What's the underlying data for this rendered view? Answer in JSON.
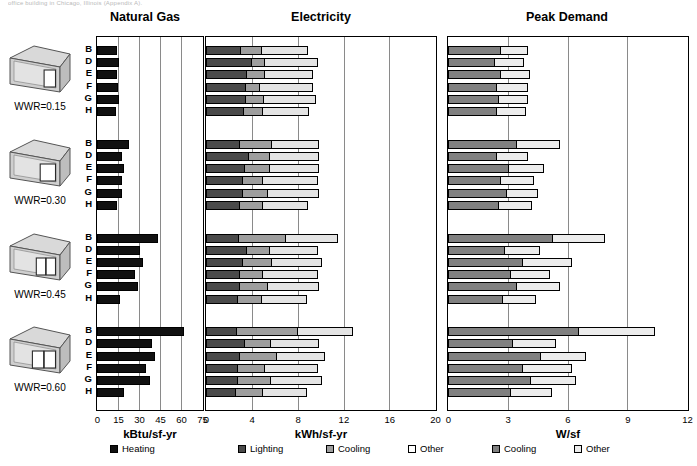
{
  "caption": "office building in Chicago, Illinois (Appendix A).",
  "panels": {
    "gas": {
      "title": "Natural Gas",
      "axis_label": "kBtu/sf-yr",
      "ticks": [
        0,
        15,
        30,
        45,
        60,
        75
      ],
      "xmax": 75
    },
    "elec": {
      "title": "Electricity",
      "axis_label": "kWh/sf-yr",
      "ticks": [
        0,
        4,
        8,
        12,
        16,
        20
      ],
      "xmax": 20
    },
    "peak": {
      "title": "Peak Demand",
      "axis_label": "W/sf",
      "ticks": [
        0,
        3,
        6,
        9,
        12
      ],
      "xmax": 12
    }
  },
  "groups": [
    {
      "wwr_label": "WWR=0.15",
      "wwr": 0.15
    },
    {
      "wwr_label": "WWR=0.30",
      "wwr": 0.3
    },
    {
      "wwr_label": "WWR=0.45",
      "wwr": 0.45
    },
    {
      "wwr_label": "WWR=0.60",
      "wwr": 0.6
    }
  ],
  "row_labels": [
    "B",
    "D",
    "E",
    "F",
    "G",
    "H"
  ],
  "legends": {
    "gas": [
      {
        "label": "Heating",
        "color": "#111111"
      }
    ],
    "elec": [
      {
        "label": "Lighting",
        "color": "#4a4a4a"
      },
      {
        "label": "Cooling",
        "color": "#9e9e9e"
      },
      {
        "label": "Other",
        "color": "#ffffff"
      }
    ],
    "peak": [
      {
        "label": "Cooling",
        "color": "#808080"
      },
      {
        "label": "Other",
        "color": "#ececec"
      }
    ]
  },
  "colors": {
    "heating": "#111111",
    "lighting": "#4a4a4a",
    "cooling_elec": "#9e9e9e",
    "other_elec": "#e4e4e4",
    "cooling_peak": "#808080",
    "other_peak": "#ececec",
    "axis": "#000000",
    "grid": "#8a8a8a"
  },
  "chart_data": [
    {
      "type": "bar",
      "orientation": "horizontal",
      "title": "Natural Gas",
      "xlabel": "kBtu/sf-yr",
      "ylabel": "",
      "xlim": [
        0,
        75
      ],
      "xticks": [
        0,
        15,
        30,
        45,
        60,
        75
      ],
      "grid": true,
      "legend_position": "bottom",
      "groups": [
        "WWR=0.15",
        "WWR=0.30",
        "WWR=0.45",
        "WWR=0.60"
      ],
      "categories": [
        "B",
        "D",
        "E",
        "F",
        "G",
        "H"
      ],
      "series": [
        {
          "name": "Heating",
          "color": "#111111",
          "values_by_group": [
            [
              14.0,
              16.0,
              14.5,
              15.0,
              15.5,
              13.5
            ],
            [
              22.5,
              18.0,
              19.5,
              17.5,
              18.0,
              14.5
            ],
            [
              43.5,
              30.5,
              33.0,
              27.0,
              29.5,
              16.5
            ],
            [
              62.0,
              39.5,
              41.5,
              35.0,
              37.5,
              19.5
            ]
          ]
        }
      ]
    },
    {
      "type": "bar",
      "orientation": "horizontal",
      "title": "Electricity",
      "xlabel": "kWh/sf-yr",
      "ylabel": "",
      "xlim": [
        0,
        20
      ],
      "xticks": [
        0,
        4,
        8,
        12,
        16,
        20
      ],
      "grid": true,
      "legend_position": "bottom",
      "stacked": true,
      "groups": [
        "WWR=0.15",
        "WWR=0.30",
        "WWR=0.45",
        "WWR=0.60"
      ],
      "categories": [
        "B",
        "D",
        "E",
        "F",
        "G",
        "H"
      ],
      "series": [
        {
          "name": "Lighting",
          "color": "#4a4a4a",
          "values_by_group": [
            [
              3.0,
              3.9,
              3.5,
              3.4,
              3.4,
              3.2
            ],
            [
              2.9,
              3.7,
              3.3,
              3.1,
              3.1,
              2.9
            ],
            [
              2.8,
              3.5,
              3.1,
              2.9,
              2.9,
              2.7
            ],
            [
              2.6,
              3.3,
              2.9,
              2.7,
              2.7,
              2.5
            ]
          ]
        },
        {
          "name": "Cooling",
          "color": "#9e9e9e",
          "values_by_group": [
            [
              1.8,
              1.2,
              1.6,
              1.2,
              1.6,
              1.7
            ],
            [
              2.8,
              1.8,
              2.2,
              1.8,
              2.2,
              2.0
            ],
            [
              4.1,
              2.0,
              2.6,
              2.0,
              2.4,
              2.1
            ],
            [
              5.3,
              2.3,
              3.2,
              2.4,
              2.9,
              2.4
            ]
          ]
        },
        {
          "name": "Other",
          "color": "#e4e4e4",
          "values_by_group": [
            [
              4.1,
              4.7,
              4.2,
              4.7,
              4.6,
              4.1
            ],
            [
              4.2,
              4.4,
              4.4,
              4.9,
              4.6,
              4.0
            ],
            [
              4.6,
              4.3,
              4.4,
              4.9,
              4.6,
              4.0
            ],
            [
              4.9,
              4.3,
              4.3,
              4.7,
              4.5,
              3.9
            ]
          ]
        }
      ]
    },
    {
      "type": "bar",
      "orientation": "horizontal",
      "title": "Peak Demand",
      "xlabel": "W/sf",
      "ylabel": "",
      "xlim": [
        0,
        12
      ],
      "xticks": [
        0,
        3,
        6,
        9,
        12
      ],
      "grid": true,
      "legend_position": "bottom",
      "stacked": true,
      "groups": [
        "WWR=0.15",
        "WWR=0.30",
        "WWR=0.45",
        "WWR=0.60"
      ],
      "categories": [
        "B",
        "D",
        "E",
        "F",
        "G",
        "H"
      ],
      "series": [
        {
          "name": "Cooling",
          "color": "#808080",
          "values_by_group": [
            [
              2.6,
              2.3,
              2.6,
              2.4,
              2.5,
              2.4
            ],
            [
              3.4,
              2.4,
              3.0,
              2.6,
              2.9,
              2.5
            ],
            [
              5.2,
              2.8,
              3.7,
              3.1,
              3.4,
              2.7
            ],
            [
              6.5,
              3.2,
              4.6,
              3.7,
              4.1,
              3.1
            ]
          ]
        },
        {
          "name": "Other",
          "color": "#ececec",
          "values_by_group": [
            [
              1.4,
              1.5,
              1.5,
              1.6,
              1.5,
              1.5
            ],
            [
              2.2,
              1.6,
              1.8,
              1.7,
              1.6,
              1.7
            ],
            [
              2.7,
              1.8,
              2.5,
              2.0,
              2.2,
              1.7
            ],
            [
              3.9,
              2.2,
              2.3,
              2.5,
              2.3,
              2.1
            ]
          ]
        }
      ]
    }
  ]
}
